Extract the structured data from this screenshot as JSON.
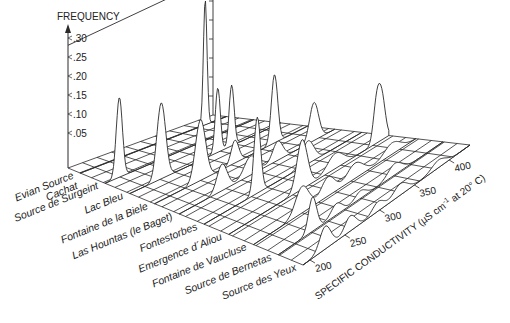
{
  "chart_data": {
    "type": "area",
    "subtype": "3d-stacked-frequency-distributions",
    "title": "",
    "zlabel": "FREQUENCY",
    "xlabel": "SPECIFIC CONDUCTIVITY (µS cm⁻¹ at 20° C)",
    "xlabel_parts": {
      "main": "SPECIFIC CONDUCTIVITY (",
      "mu": "µ",
      "unit": "S cm",
      "sup": "-1",
      "rest": " at 20° C)"
    },
    "ylabel": "",
    "z_ticks": [
      ".05",
      ".10",
      ".15",
      ".20",
      ".25",
      ".30"
    ],
    "z_tick_values": [
      0.05,
      0.1,
      0.15,
      0.2,
      0.25,
      0.3
    ],
    "x_ticks": [
      "200",
      "250",
      "300",
      "350",
      "400"
    ],
    "x_tick_values": [
      200,
      250,
      300,
      350,
      400
    ],
    "xlim": [
      190,
      430
    ],
    "zlim": [
      0,
      0.32
    ],
    "grid": true,
    "categories": [
      "Evian Source Cachat",
      "Source de Surgeint",
      "Lac Bleu",
      "Fontaine de la Biele",
      "Las Hountas (le Baget)",
      "Fontestorbes",
      "Emergence d'Aliou",
      "Fontaine de Vaucluse",
      "Source de Bernetas",
      "Source des Yeux"
    ],
    "category_label_lines": [
      [
        "Evian Source",
        "Cachat"
      ],
      [
        "Source de Surgeint"
      ],
      [
        "Lac Bleu"
      ],
      [
        "Fontaine de la Biele"
      ],
      [
        "Las Hountas (le Baget)"
      ],
      [
        "Fontestorbes"
      ],
      [
        "Emergence d´Aliou"
      ],
      [
        "Fontaine de Vaucluse"
      ],
      [
        "Source de Bernetas"
      ],
      [
        "Source des Yeux"
      ]
    ],
    "series": [
      {
        "name": "Evian Source Cachat",
        "peaks": [
          {
            "x": 395,
            "height": 0.33,
            "width": 3
          }
        ]
      },
      {
        "name": "Source de Surgeint",
        "peaks": [
          {
            "x": 213,
            "height": 0.21,
            "width": 5
          }
        ]
      },
      {
        "name": "Lac Bleu",
        "peaks": [
          {
            "x": 240,
            "height": 0.2,
            "width": 7
          },
          {
            "x": 330,
            "height": 0.17,
            "width": 4
          },
          {
            "x": 352,
            "height": 0.16,
            "width": 4
          }
        ]
      },
      {
        "name": "Fontaine de la Biele",
        "peaks": [
          {
            "x": 262,
            "height": 0.16,
            "width": 8
          },
          {
            "x": 316,
            "height": 0.06,
            "width": 6
          },
          {
            "x": 378,
            "height": 0.18,
            "width": 5
          }
        ]
      },
      {
        "name": "Las Hountas (le Baget)",
        "peaks": [
          {
            "x": 256,
            "height": 0.07,
            "width": 8
          },
          {
            "x": 300,
            "height": 0.05,
            "width": 10
          },
          {
            "x": 342,
            "height": 0.05,
            "width": 8
          },
          {
            "x": 398,
            "height": 0.1,
            "width": 7
          }
        ]
      },
      {
        "name": "Fontestorbes",
        "peaks": [
          {
            "x": 271,
            "height": 0.2,
            "width": 5
          },
          {
            "x": 348,
            "height": 0.06,
            "width": 9
          }
        ]
      },
      {
        "name": "Emergence d'Aliou",
        "peaks": [
          {
            "x": 300,
            "height": 0.13,
            "width": 8
          },
          {
            "x": 350,
            "height": 0.04,
            "width": 12
          },
          {
            "x": 412,
            "height": 0.11,
            "width": 5
          },
          {
            "x": 420,
            "height": 0.1,
            "width": 5
          }
        ]
      },
      {
        "name": "Fontaine de Vaucluse",
        "peaks": [
          {
            "x": 262,
            "height": 0.07,
            "width": 10
          },
          {
            "x": 300,
            "height": 0.05,
            "width": 10
          },
          {
            "x": 340,
            "height": 0.04,
            "width": 12
          },
          {
            "x": 395,
            "height": 0.03,
            "width": 12
          }
        ]
      },
      {
        "name": "Source de Bernetas",
        "peaks": [
          {
            "x": 240,
            "height": 0.09,
            "width": 6
          },
          {
            "x": 275,
            "height": 0.03,
            "width": 8
          },
          {
            "x": 310,
            "height": 0.02,
            "width": 8
          },
          {
            "x": 360,
            "height": 0.03,
            "width": 10
          }
        ]
      },
      {
        "name": "Source des Yeux",
        "peaks": [
          {
            "x": 222,
            "height": 0.06,
            "width": 8
          },
          {
            "x": 258,
            "height": 0.04,
            "width": 8
          },
          {
            "x": 298,
            "height": 0.025,
            "width": 8
          },
          {
            "x": 330,
            "height": 0.03,
            "width": 10
          },
          {
            "x": 385,
            "height": 0.02,
            "width": 10
          }
        ]
      }
    ]
  },
  "colors": {
    "line": "#2a2a2a",
    "fill": "#ffffff",
    "text": "#222222"
  }
}
